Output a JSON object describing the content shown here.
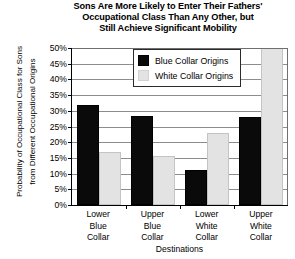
{
  "chart_data": {
    "type": "bar",
    "title": "Sons Are More Likely to Enter Their Fathers' Occupational Class Than Any Other, but Still Achieve Significant Mobility",
    "title_lines": [
      "Sons Are More Likely to Enter Their Fathers'",
      "Occupational Class Than Any Other, but",
      "Still Achieve Significant Mobility"
    ],
    "xlabel": "Destinations",
    "ylabel": "Probability of Occupational Class for Sons from Different Occupational Origins",
    "ylabel_lines": [
      "Probability of Occupational Class for Sons",
      "from Different Occupational Origins"
    ],
    "categories": [
      "Lower Blue Collar",
      "Upper Blue Collar",
      "Lower White Collar",
      "Upper White Collar"
    ],
    "category_lines": [
      [
        "Lower",
        "Blue",
        "Collar"
      ],
      [
        "Upper",
        "Blue",
        "Collar"
      ],
      [
        "Lower",
        "White",
        "Collar"
      ],
      [
        "Upper",
        "White",
        "Collar"
      ]
    ],
    "series": [
      {
        "name": "Blue Collar Origins",
        "color": "#0a0a0a",
        "values": [
          32,
          28.5,
          11,
          28
        ]
      },
      {
        "name": "White Collar Origins",
        "color": "#e3e3e3",
        "values": [
          17,
          15.5,
          23,
          51
        ]
      }
    ],
    "ylim": [
      0,
      50
    ],
    "ytick_step": 5,
    "ytick_labels": [
      "50%",
      "45%",
      "40%",
      "35%",
      "30%",
      "25%",
      "20%",
      "15%",
      "10%",
      "5%",
      "0%"
    ],
    "ytick_values": [
      50,
      45,
      40,
      35,
      30,
      25,
      20,
      15,
      10,
      5,
      0
    ],
    "grid": true,
    "legend_position": "top-center-inside"
  },
  "legend": {
    "entries": [
      {
        "label": "Blue Collar Origins",
        "swatch": "blue-collar"
      },
      {
        "label": "White Collar Origins",
        "swatch": "white-collar"
      }
    ]
  }
}
